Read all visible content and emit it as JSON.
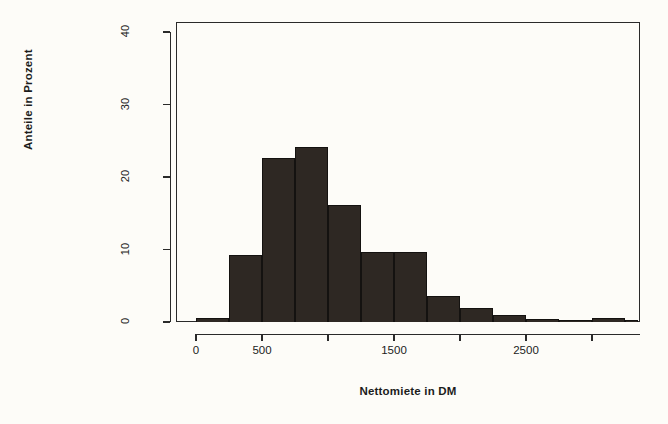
{
  "chart_data": {
    "type": "bar",
    "title": "",
    "subtitle": "",
    "xlabel": "Nettomiete in DM",
    "ylabel": "Anteile in Prozent",
    "xlim": [
      0,
      3350
    ],
    "ylim": [
      0,
      42
    ],
    "grid": false,
    "legend": null,
    "bin_width": 250,
    "x_tick_values": [
      0,
      500,
      1000,
      1500,
      2000,
      2500,
      3000
    ],
    "x_tick_labels": [
      "0",
      "500",
      "",
      "1500",
      "",
      "2500",
      ""
    ],
    "y_tick_values": [
      0,
      10,
      20,
      30,
      40
    ],
    "y_tick_labels": [
      "0",
      "10",
      "20",
      "30",
      "40"
    ],
    "bin_starts": [
      0,
      250,
      500,
      750,
      1000,
      1250,
      1500,
      1750,
      2000,
      2250,
      2500,
      2750,
      3000,
      3250
    ],
    "categories": [
      "0-250",
      "250-500",
      "500-750",
      "750-1000",
      "1000-1250",
      "1250-1500",
      "1500-1750",
      "1750-2000",
      "2000-2250",
      "2250-2500",
      "2500-2750",
      "2750-3000",
      "3000-3250",
      "3250-3350"
    ],
    "values": [
      0.6,
      9.2,
      22.6,
      24.2,
      16.1,
      9.6,
      9.6,
      3.6,
      2.0,
      1.0,
      0.4,
      0.3,
      0.5,
      0.3
    ],
    "bar_color": "#2e2823",
    "axis_color": "#2a2a2a",
    "background_color": "#fdfcf8"
  },
  "chart": {
    "xlabel": "Nettomiete in DM",
    "ylabel": "Anteile in Prozent"
  }
}
